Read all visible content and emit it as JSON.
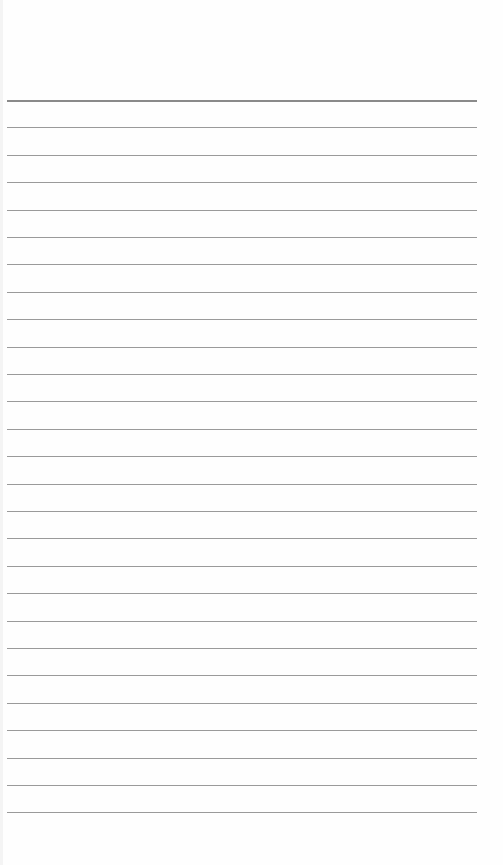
{
  "page": {
    "type": "lined-paper",
    "background": "#fefefe",
    "line_color": "#9a9a9a",
    "header_line_color": "#8a8a8a",
    "first_line_y": 100,
    "line_spacing": 27.4,
    "line_count": 27,
    "line_left": 7,
    "line_width": 470
  }
}
